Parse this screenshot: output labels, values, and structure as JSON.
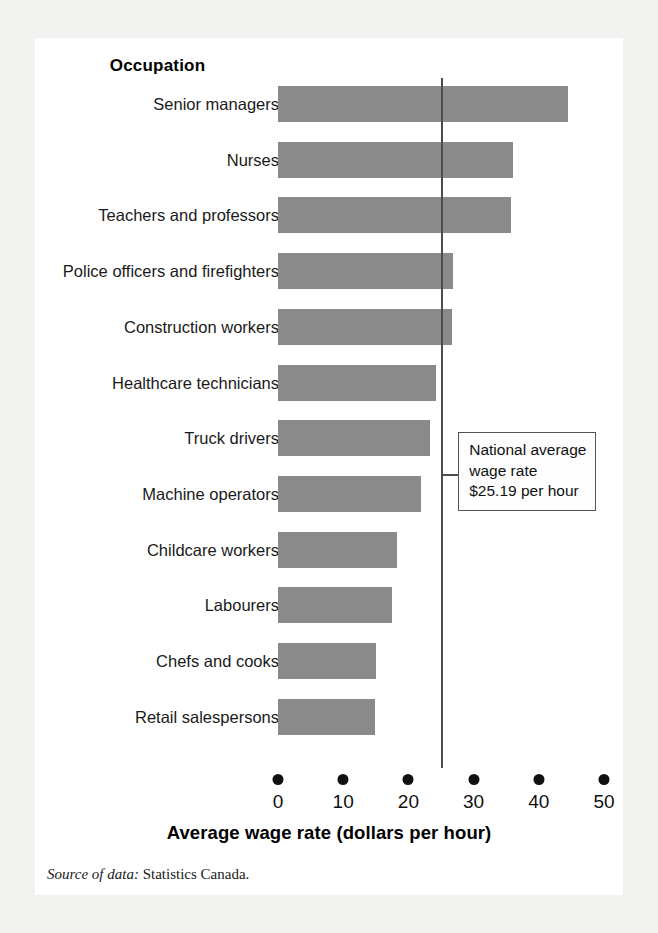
{
  "card": {
    "column_header": "Occupation"
  },
  "chart_data": {
    "type": "bar",
    "orientation": "horizontal",
    "title": "",
    "xlabel": "Average wage rate (dollars per hour)",
    "ylabel": "Occupation",
    "xlim": [
      0,
      50
    ],
    "xticks": [
      0,
      10,
      20,
      30,
      40,
      50
    ],
    "xticklabels": [
      "0",
      "10",
      "20",
      "30",
      "40",
      "50"
    ],
    "grid": false,
    "legend": "none",
    "bar_color": "#8a8a8a",
    "categories": [
      "Senior managers",
      "Nurses",
      "Teachers and professors",
      "Police officers and firefighters",
      "Construction workers",
      "Healthcare technicians",
      "Truck drivers",
      "Machine operators",
      "Childcare workers",
      "Labourers",
      "Chefs and cooks",
      "Retail salespersons"
    ],
    "values": [
      44.5,
      36.0,
      35.7,
      26.8,
      26.7,
      24.2,
      23.3,
      22.0,
      18.3,
      17.5,
      15.0,
      14.9
    ],
    "reference_line": {
      "value": 25.19,
      "label_lines": [
        "National average",
        "wage rate",
        "$25.19 per hour"
      ],
      "color": "#4d4d4d"
    }
  },
  "source": {
    "label": "Source of data:",
    "value": " Statistics Canada."
  }
}
